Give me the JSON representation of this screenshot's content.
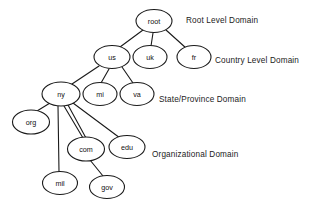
{
  "diagram": {
    "stroke_color": "#1a1a1a",
    "node_fill": "#ffffff",
    "text_color": "#111111",
    "background": "#ffffff",
    "nodes": [
      {
        "id": "root",
        "label": "root",
        "cx": 154,
        "cy": 21,
        "rx": 18,
        "ry": 11.5
      },
      {
        "id": "us",
        "label": "us",
        "cx": 112,
        "cy": 57,
        "rx": 18,
        "ry": 11.5
      },
      {
        "id": "uk",
        "label": "uk",
        "cx": 150,
        "cy": 57,
        "rx": 17,
        "ry": 11.5
      },
      {
        "id": "fr",
        "label": "fr",
        "cx": 194,
        "cy": 57,
        "rx": 17,
        "ry": 11.5
      },
      {
        "id": "ny",
        "label": "ny",
        "cx": 61,
        "cy": 94,
        "rx": 19,
        "ry": 12
      },
      {
        "id": "mi",
        "label": "mi",
        "cx": 100,
        "cy": 94,
        "rx": 17,
        "ry": 11.5
      },
      {
        "id": "va",
        "label": "va",
        "cx": 137,
        "cy": 94,
        "rx": 17,
        "ry": 11.5
      },
      {
        "id": "org",
        "label": "org",
        "cx": 31,
        "cy": 122,
        "rx": 18.5,
        "ry": 12
      },
      {
        "id": "com",
        "label": "com",
        "cx": 86,
        "cy": 149,
        "rx": 18.5,
        "ry": 12
      },
      {
        "id": "edu",
        "label": "edu",
        "cx": 127,
        "cy": 147,
        "rx": 18,
        "ry": 11.5
      },
      {
        "id": "mil",
        "label": "mil",
        "cx": 60,
        "cy": 183,
        "rx": 17.5,
        "ry": 11.5
      },
      {
        "id": "gov",
        "label": "gov",
        "cx": 107,
        "cy": 187,
        "rx": 17.5,
        "ry": 11.5
      }
    ],
    "edges": [
      {
        "from": "root",
        "to": "us",
        "x1": 143,
        "y1": 30,
        "x2": 120,
        "y2": 47
      },
      {
        "from": "root",
        "to": "uk",
        "x1": 153,
        "y1": 33,
        "x2": 151,
        "y2": 46
      },
      {
        "from": "root",
        "to": "fr",
        "x1": 166,
        "y1": 30,
        "x2": 186,
        "y2": 48
      },
      {
        "from": "us",
        "to": "ny",
        "x1": 99,
        "y1": 66,
        "x2": 72,
        "y2": 84
      },
      {
        "from": "us",
        "to": "mi",
        "x1": 109,
        "y1": 69,
        "x2": 101,
        "y2": 83
      },
      {
        "from": "us",
        "to": "va",
        "x1": 122,
        "y1": 67,
        "x2": 133,
        "y2": 83
      },
      {
        "from": "ny",
        "to": "org",
        "x1": 50,
        "y1": 103,
        "x2": 37,
        "y2": 111
      },
      {
        "from": "ny",
        "to": "mil",
        "x1": 58,
        "y1": 106,
        "x2": 59,
        "y2": 172
      },
      {
        "from": "ny",
        "to": "com",
        "x1": 64,
        "y1": 106,
        "x2": 83,
        "y2": 138
      },
      {
        "from": "ny",
        "to": "com2",
        "x1": 68,
        "y1": 105,
        "x2": 86,
        "y2": 138
      },
      {
        "from": "ny",
        "to": "edu",
        "x1": 73,
        "y1": 103,
        "x2": 120,
        "y2": 138
      },
      {
        "from": "com",
        "to": "gov",
        "x1": 90,
        "y1": 160,
        "x2": 103,
        "y2": 176
      }
    ],
    "tier_labels": [
      {
        "id": "root-level",
        "text": "Root Level Domain",
        "x": 186,
        "y": 20
      },
      {
        "id": "country-level",
        "text": "Country Level Domain",
        "x": 215,
        "y": 60
      },
      {
        "id": "state-level",
        "text": "State/Province Domain",
        "x": 159,
        "y": 99
      },
      {
        "id": "org-level",
        "text": "Organizational Domain",
        "x": 152,
        "y": 154
      }
    ]
  }
}
